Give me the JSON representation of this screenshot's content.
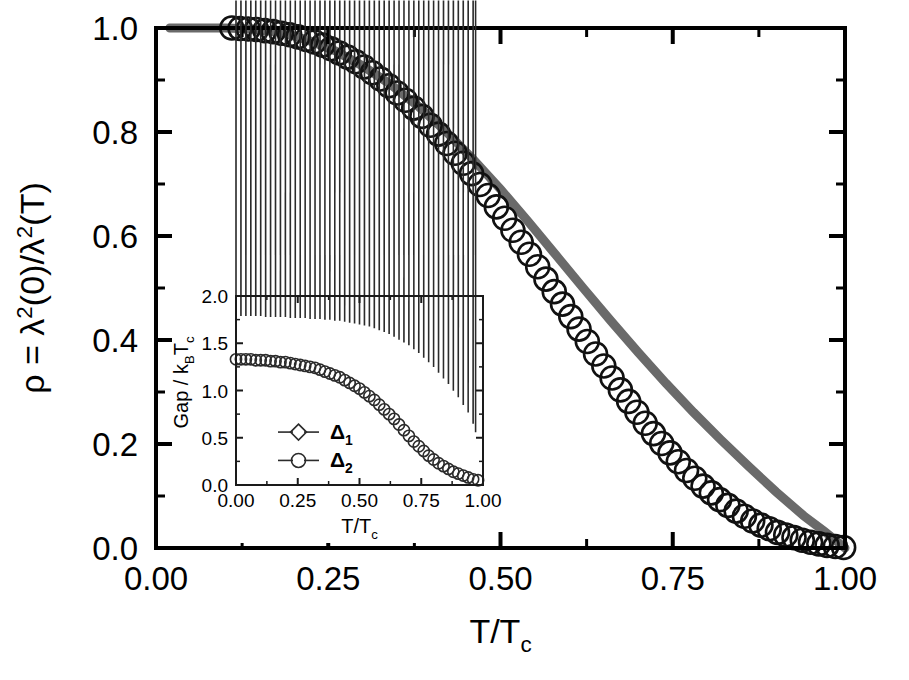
{
  "figure": {
    "background_color": "#ffffff",
    "main_axes": {
      "x": 156,
      "y": 28,
      "width": 689,
      "height": 520
    },
    "inset_axes": {
      "x": 236,
      "y": 296,
      "width": 247,
      "height": 189
    }
  },
  "chart_data": {
    "type": "scatter",
    "title": "",
    "xlabel": "T/T",
    "xlabel_sub": "c",
    "ylabel_parts": {
      "rho": "ρ",
      "equals": " = ",
      "lambda": "λ",
      "sup2": "2",
      "zero": "(0)/",
      "lambda2": "λ",
      "tee": "(T)"
    },
    "ylabel_plain": "ρ = λ²(0)/λ²(T)",
    "xlim": [
      0.0,
      1.0
    ],
    "ylim": [
      0.0,
      1.0
    ],
    "xticks": [
      0.0,
      0.25,
      0.5,
      0.75,
      1.0
    ],
    "xticklabels": [
      "0.00",
      "0.25",
      "0.50",
      "0.75",
      "1.00"
    ],
    "yticks": [
      0.0,
      0.2,
      0.4,
      0.6,
      0.8,
      1.0
    ],
    "yticklabels": [
      "0.0",
      "0.2",
      "0.4",
      "0.6",
      "0.8",
      "1.0"
    ],
    "x_minor_count": 1,
    "y_minor_count": 1,
    "grid": false,
    "legend": "none",
    "series": [
      {
        "name": "superfluid-density-data",
        "marker": "open-circle",
        "marker_color": "#111111",
        "x": [
          0.11,
          0.122,
          0.134,
          0.146,
          0.158,
          0.17,
          0.182,
          0.194,
          0.206,
          0.218,
          0.23,
          0.242,
          0.254,
          0.266,
          0.278,
          0.29,
          0.302,
          0.314,
          0.326,
          0.338,
          0.35,
          0.362,
          0.374,
          0.386,
          0.398,
          0.41,
          0.422,
          0.434,
          0.446,
          0.458,
          0.47,
          0.482,
          0.494,
          0.506,
          0.518,
          0.53,
          0.542,
          0.554,
          0.566,
          0.578,
          0.59,
          0.602,
          0.614,
          0.626,
          0.638,
          0.65,
          0.662,
          0.674,
          0.686,
          0.698,
          0.71,
          0.722,
          0.734,
          0.746,
          0.758,
          0.77,
          0.782,
          0.794,
          0.806,
          0.818,
          0.83,
          0.842,
          0.854,
          0.866,
          0.878,
          0.89,
          0.902,
          0.914,
          0.926,
          0.938,
          0.95,
          0.962,
          0.974,
          0.986,
          0.998
        ],
        "y": [
          1.0,
          0.999,
          0.998,
          0.997,
          0.995,
          0.993,
          0.99,
          0.987,
          0.983,
          0.978,
          0.973,
          0.967,
          0.96,
          0.952,
          0.944,
          0.935,
          0.925,
          0.914,
          0.902,
          0.889,
          0.875,
          0.861,
          0.846,
          0.83,
          0.813,
          0.796,
          0.778,
          0.759,
          0.74,
          0.72,
          0.699,
          0.678,
          0.656,
          0.634,
          0.611,
          0.588,
          0.565,
          0.541,
          0.517,
          0.493,
          0.469,
          0.445,
          0.421,
          0.397,
          0.373,
          0.35,
          0.327,
          0.304,
          0.282,
          0.261,
          0.24,
          0.22,
          0.201,
          0.183,
          0.166,
          0.149,
          0.134,
          0.119,
          0.106,
          0.093,
          0.082,
          0.071,
          0.061,
          0.052,
          0.044,
          0.037,
          0.03,
          0.025,
          0.02,
          0.015,
          0.011,
          0.008,
          0.005,
          0.003,
          0.001
        ]
      },
      {
        "name": "two-gap-fit",
        "marker": "none",
        "line_color": "#6a6a6a",
        "line_width": 9,
        "x": [
          0.02,
          0.06,
          0.1,
          0.14,
          0.18,
          0.22,
          0.26,
          0.3,
          0.34,
          0.38,
          0.42,
          0.46,
          0.5,
          0.54,
          0.58,
          0.62,
          0.66,
          0.7,
          0.74,
          0.78,
          0.82,
          0.86,
          0.9,
          0.94,
          0.97,
          1.0
        ],
        "y": [
          1.0,
          1.0,
          1.0,
          0.998,
          0.992,
          0.977,
          0.956,
          0.927,
          0.892,
          0.85,
          0.802,
          0.748,
          0.69,
          0.628,
          0.564,
          0.5,
          0.437,
          0.376,
          0.317,
          0.261,
          0.208,
          0.157,
          0.108,
          0.062,
          0.032,
          0.0
        ]
      }
    ]
  },
  "inset_chart_data": {
    "type": "scatter",
    "title": "",
    "xlabel": "T/T",
    "xlabel_sub": "c",
    "ylabel_plain": "Gap / k_B T_c",
    "ylabel_parts": {
      "gap": "Gap / k",
      "b": "B",
      "t": "T",
      "c": "c"
    },
    "xlim": [
      0.0,
      1.0
    ],
    "ylim": [
      0.0,
      2.0
    ],
    "xticks": [
      0.0,
      0.25,
      0.5,
      0.75,
      1.0
    ],
    "xticklabels": [
      "0.00",
      "0.25",
      "0.50",
      "0.75",
      "1.00"
    ],
    "yticks": [
      0.0,
      0.5,
      1.0,
      1.5,
      2.0
    ],
    "yticklabels": [
      "0.0",
      "0.5",
      "1.0",
      "1.5",
      "2.0"
    ],
    "x_minor_count": 1,
    "y_minor_count": 1,
    "grid": false,
    "legend_position": "lower-left",
    "series": [
      {
        "name": "delta-1",
        "legend_label": "Δ",
        "legend_sub": "1",
        "marker": "open-diamond",
        "marker_color": "#2b2b2b",
        "x": [
          0.0,
          0.02,
          0.04,
          0.06,
          0.08,
          0.1,
          0.12,
          0.14,
          0.16,
          0.18,
          0.2,
          0.22,
          0.24,
          0.26,
          0.28,
          0.3,
          0.32,
          0.34,
          0.36,
          0.38,
          0.4,
          0.42,
          0.44,
          0.46,
          0.48,
          0.5,
          0.52,
          0.54,
          0.56,
          0.58,
          0.6,
          0.62,
          0.64,
          0.66,
          0.68,
          0.7,
          0.72,
          0.74,
          0.76,
          0.78,
          0.8,
          0.82,
          0.84,
          0.86,
          0.88,
          0.9,
          0.92,
          0.94,
          0.96,
          0.97
        ],
        "y": [
          1.72,
          1.72,
          1.72,
          1.72,
          1.72,
          1.72,
          1.71,
          1.71,
          1.71,
          1.71,
          1.71,
          1.7,
          1.7,
          1.7,
          1.7,
          1.69,
          1.69,
          1.69,
          1.68,
          1.68,
          1.67,
          1.67,
          1.66,
          1.65,
          1.64,
          1.63,
          1.62,
          1.61,
          1.59,
          1.57,
          1.55,
          1.53,
          1.5,
          1.47,
          1.44,
          1.41,
          1.37,
          1.33,
          1.28,
          1.23,
          1.18,
          1.12,
          1.06,
          1.0,
          0.93,
          0.86,
          0.78,
          0.7,
          0.58,
          0.49
        ]
      },
      {
        "name": "delta-2",
        "legend_label": "Δ",
        "legend_sub": "2",
        "marker": "open-circle",
        "marker_color": "#2b2b2b",
        "x": [
          0.0,
          0.02,
          0.04,
          0.06,
          0.08,
          0.1,
          0.12,
          0.14,
          0.16,
          0.18,
          0.2,
          0.22,
          0.24,
          0.26,
          0.28,
          0.3,
          0.32,
          0.34,
          0.36,
          0.38,
          0.4,
          0.42,
          0.44,
          0.46,
          0.48,
          0.5,
          0.52,
          0.54,
          0.56,
          0.58,
          0.6,
          0.62,
          0.64,
          0.66,
          0.68,
          0.7,
          0.72,
          0.74,
          0.76,
          0.78,
          0.8,
          0.82,
          0.84,
          0.86,
          0.88,
          0.9,
          0.92,
          0.94,
          0.96,
          0.98
        ],
        "y": [
          1.33,
          1.33,
          1.33,
          1.33,
          1.32,
          1.32,
          1.32,
          1.31,
          1.31,
          1.3,
          1.3,
          1.29,
          1.28,
          1.27,
          1.26,
          1.25,
          1.24,
          1.22,
          1.2,
          1.18,
          1.16,
          1.14,
          1.11,
          1.08,
          1.05,
          1.02,
          0.98,
          0.94,
          0.9,
          0.85,
          0.8,
          0.75,
          0.7,
          0.64,
          0.58,
          0.52,
          0.46,
          0.41,
          0.36,
          0.31,
          0.27,
          0.23,
          0.2,
          0.17,
          0.14,
          0.12,
          0.1,
          0.08,
          0.06,
          0.05
        ]
      }
    ]
  }
}
